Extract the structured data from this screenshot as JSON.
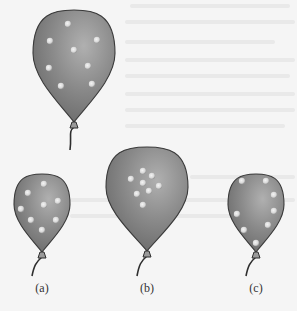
{
  "figure": {
    "background_color": "#f5f5f5",
    "balloon_fill_dark": "#6e6e6e",
    "balloon_fill_light": "#b0b0b0",
    "outline_color": "#3a3a3a",
    "dot_color": "#d8d8d8",
    "balloons": [
      {
        "id": "top",
        "label": "",
        "cx": 74,
        "top": 10,
        "rx": 41,
        "knot_y": 124,
        "string_end": [
          70,
          150
        ],
        "dots": [
          [
            68,
            24
          ],
          [
            50,
            41
          ],
          [
            97,
            40
          ],
          [
            74,
            50
          ],
          [
            49,
            68
          ],
          [
            88,
            66
          ],
          [
            61,
            86
          ],
          [
            92,
            84
          ]
        ]
      },
      {
        "id": "a",
        "label": "(a)",
        "cx": 42,
        "top": 174,
        "rx": 28,
        "knot_y": 254,
        "string_end": [
          32,
          276
        ],
        "dots": [
          [
            44,
            184
          ],
          [
            28,
            193
          ],
          [
            58,
            201
          ],
          [
            44,
            205
          ],
          [
            21,
            209
          ],
          [
            31,
            220
          ],
          [
            56,
            220
          ],
          [
            42,
            230
          ]
        ]
      },
      {
        "id": "b",
        "label": "(b)",
        "cx": 147,
        "top": 147,
        "rx": 41,
        "knot_y": 253,
        "string_end": [
          137,
          276
        ],
        "dots": [
          [
            143,
            171
          ],
          [
            152,
            176
          ],
          [
            131,
            179
          ],
          [
            143,
            183
          ],
          [
            159,
            186
          ],
          [
            149,
            191
          ],
          [
            137,
            194
          ],
          [
            143,
            205
          ]
        ]
      },
      {
        "id": "c",
        "label": "(c)",
        "cx": 256,
        "top": 174,
        "rx": 28,
        "knot_y": 254,
        "string_end": [
          246,
          276
        ],
        "dots": [
          [
            242,
            181
          ],
          [
            266,
            181
          ],
          [
            274,
            195
          ],
          [
            274,
            211
          ],
          [
            237,
            214
          ],
          [
            268,
            225
          ],
          [
            244,
            230
          ],
          [
            256,
            243
          ]
        ]
      }
    ],
    "labels": {
      "a": "(a)",
      "b": "(b)",
      "c": "(c)"
    }
  }
}
